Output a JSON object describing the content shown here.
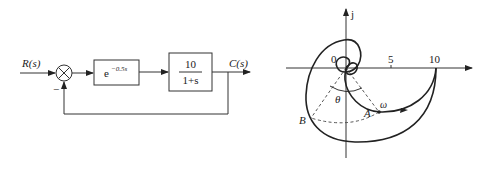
{
  "block_diagram": {
    "input_label": "R(s)",
    "output_label": "C(s)",
    "summing_junction": {
      "symbol": "×",
      "feedback_sign": "−"
    },
    "delay_block": {
      "base": "e",
      "exponent": "−0.5s"
    },
    "plant_block": {
      "numerator": "10",
      "denominator": "1+s"
    }
  },
  "nyquist_plot": {
    "imag_axis_label": "j",
    "tick_labels": [
      "0",
      "5",
      "10"
    ],
    "point_labels": {
      "A": "A",
      "B": "B"
    },
    "angle_label": "θ",
    "frequency_label": "ω"
  },
  "colors": {
    "line": "#222222",
    "background": "#ffffff"
  }
}
